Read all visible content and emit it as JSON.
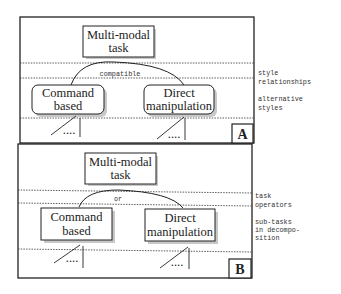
{
  "panels": [
    {
      "id": "A",
      "letter": "A",
      "root": {
        "line1": "Multi-modal",
        "line2": "task"
      },
      "relation_label": "compatible",
      "children": [
        {
          "line1": "Command",
          "line2": "based"
        },
        {
          "line1": "Direct",
          "line2": "manipulation"
        }
      ],
      "child_shape": "rounded",
      "ellipsis": "....",
      "side_labels": [
        {
          "line1": "style",
          "line2": "relationships"
        },
        {
          "line1": "alternative",
          "line2": "styles"
        }
      ]
    },
    {
      "id": "B",
      "letter": "B",
      "root": {
        "line1": "Multi-modal",
        "line2": "task"
      },
      "relation_label": "or",
      "children": [
        {
          "line1": "Command",
          "line2": "based"
        },
        {
          "line1": "Direct",
          "line2": "manipulation"
        }
      ],
      "child_shape": "square",
      "ellipsis": "....",
      "side_labels": [
        {
          "line1": "task",
          "line2": "operators"
        },
        {
          "line1": "sub-tasks",
          "line2": "in decompo-",
          "line3": "sition"
        }
      ]
    }
  ],
  "colors": {
    "ink": "#222222",
    "shadow": "#bdbdbd",
    "background": "#ffffff"
  }
}
